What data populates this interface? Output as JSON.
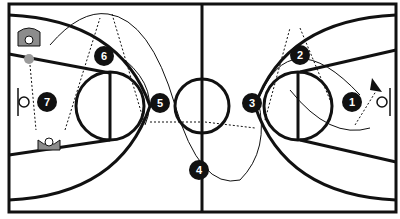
{
  "diagram": {
    "type": "basketball-play",
    "colors": {
      "line": "#111111",
      "background": "#ffffff",
      "ball": "#9a9a9a",
      "defender": "#8c8c8c"
    },
    "players": [
      {
        "label": "1",
        "x": 352,
        "y": 102
      },
      {
        "label": "2",
        "x": 300,
        "y": 55
      },
      {
        "label": "3",
        "x": 252,
        "y": 103
      },
      {
        "label": "4",
        "x": 199,
        "y": 170
      },
      {
        "label": "5",
        "x": 160,
        "y": 103
      },
      {
        "label": "6",
        "x": 104,
        "y": 56
      },
      {
        "label": "7",
        "x": 47,
        "y": 102
      }
    ],
    "defenders": [
      {
        "name": "defender-top-left",
        "x": 29,
        "y": 40
      },
      {
        "name": "defender-bottom-left",
        "x": 49,
        "y": 142
      }
    ],
    "ball": {
      "x": 29,
      "y": 59
    }
  }
}
